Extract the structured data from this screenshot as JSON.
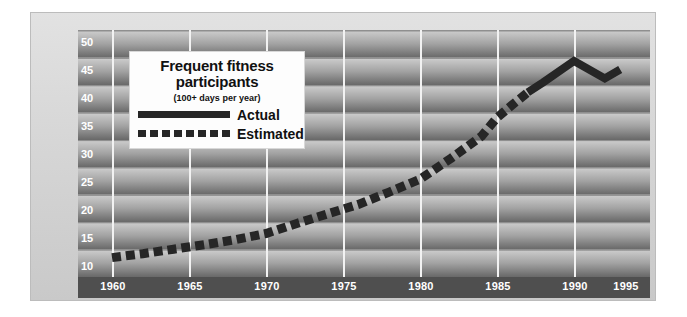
{
  "chart_data": {
    "type": "line",
    "title": "Frequent fitness participants",
    "subtitle": "(100+ days per year)",
    "xlabel": "",
    "ylabel": "U.S. participants (in millions)",
    "xlim": [
      1960,
      1995
    ],
    "ylim": [
      8,
      51
    ],
    "grid": "vertical gridlines at each 5-year tick; horizontal banded shading every 5 units",
    "legend_position": "upper-left inside plot",
    "xticks": [
      "1960",
      "1965",
      "1970",
      "1975",
      "1980",
      "1985",
      "1990",
      "1995"
    ],
    "yticks": [
      "10",
      "15",
      "20",
      "25",
      "30",
      "35",
      "40",
      "45",
      "50"
    ],
    "series": [
      {
        "name": "Estimated",
        "style": "dashed",
        "color": "#262626",
        "x": [
          1960,
          1962,
          1964,
          1966,
          1968,
          1970,
          1972,
          1974,
          1976,
          1978,
          1980,
          1982,
          1984,
          1985,
          1986,
          1987
        ],
        "values": [
          11.5,
          12.2,
          13.0,
          13.8,
          14.7,
          15.8,
          17.6,
          19.3,
          21.0,
          23.2,
          25.5,
          29.2,
          33.2,
          36.5,
          38.8,
          41.0
        ]
      },
      {
        "name": "Actual",
        "style": "solid",
        "color": "#262626",
        "x": [
          1987,
          1988,
          1990,
          1992,
          1993
        ],
        "values": [
          41.0,
          42.8,
          46.6,
          43.5,
          45.1
        ]
      }
    ]
  },
  "legend": {
    "title_line1": "Frequent fitness",
    "title_line2": "participants",
    "subtitle": "(100+ days per year)",
    "entries": [
      {
        "label": "Actual",
        "style": "solid"
      },
      {
        "label": "Estimated",
        "style": "dashed"
      }
    ]
  },
  "axes": {
    "y_title_line1": "U.S. participants",
    "y_title_line2": "(in millions)",
    "x_tick_labels": [
      "1960",
      "1965",
      "1970",
      "1975",
      "1980",
      "1985",
      "1990",
      "1995"
    ],
    "y_tick_labels": [
      "50",
      "45",
      "40",
      "35",
      "30",
      "25",
      "20",
      "15",
      "10"
    ]
  },
  "colors": {
    "series_line": "#262626",
    "gridline": "#f2f2f2",
    "tick_text": "#ffffff",
    "axis_title_text": "#1a1a1a",
    "legend_background": "#fdfdfd",
    "panel_background": "#4b4b4b",
    "frame_background": "#d6d6d6"
  }
}
